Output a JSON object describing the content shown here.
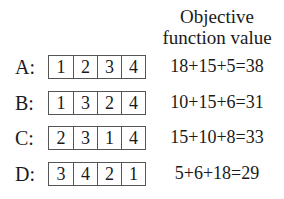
{
  "header": {
    "line1": "Objective",
    "line2": "function value"
  },
  "rows": [
    {
      "label": "A:",
      "permutation": [
        "1",
        "2",
        "3",
        "4"
      ],
      "objective": "18+15+5=38"
    },
    {
      "label": "B:",
      "permutation": [
        "1",
        "3",
        "2",
        "4"
      ],
      "objective": "10+15+6=31"
    },
    {
      "label": "C:",
      "permutation": [
        "2",
        "3",
        "1",
        "4"
      ],
      "objective": "15+10+8=33"
    },
    {
      "label": "D:",
      "permutation": [
        "3",
        "4",
        "2",
        "1"
      ],
      "objective": "5+6+18=29"
    }
  ]
}
